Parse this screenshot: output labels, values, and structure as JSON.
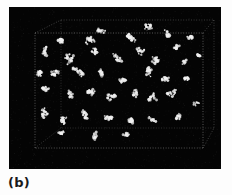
{
  "figure": {
    "caption": "(b)",
    "panel": {
      "name": "simulation-snapshot",
      "background_color": "#040404",
      "particle_color": "#f2f2f2",
      "box_edge_color": "#8a8a8a",
      "x": 9,
      "y": 7,
      "width": 212,
      "height": 162
    }
  },
  "page": {
    "background_color": "#fdfdfd",
    "text_color": "#1a1a1a"
  },
  "chart_data": {
    "type": "scatter",
    "title": "",
    "subtitle": "",
    "xlabel": "",
    "ylabel": "",
    "zlabel": "",
    "legend": [],
    "annotations": [
      "(b)"
    ],
    "grid": false,
    "projection": "3d-perspective-wireframe-cube",
    "bounding_box": {
      "front_face": {
        "x0": 35,
        "y0": 33,
        "x1": 203,
        "y1": 148
      },
      "back_face": {
        "x0": 61,
        "y0": 20,
        "x1": 214,
        "y1": 128
      },
      "edge_style": "dotted",
      "edge_color": "#8a8a8a"
    },
    "xlim": [
      0,
      1
    ],
    "ylim": [
      0,
      1
    ],
    "zlim": [
      0,
      1
    ],
    "series": [
      {
        "name": "aggregate clusters",
        "marker": "fractal-cluster",
        "color": "#f2f2f2",
        "cluster_count": 42,
        "clusters": [
          {
            "cx": 62,
            "cy": 42,
            "r": 7,
            "n": 16
          },
          {
            "cx": 90,
            "cy": 36,
            "r": 9,
            "n": 20
          },
          {
            "cx": 103,
            "cy": 31,
            "r": 6,
            "n": 12
          },
          {
            "cx": 129,
            "cy": 39,
            "r": 8,
            "n": 18
          },
          {
            "cx": 146,
            "cy": 30,
            "r": 7,
            "n": 15
          },
          {
            "cx": 165,
            "cy": 34,
            "r": 6,
            "n": 13
          },
          {
            "cx": 176,
            "cy": 46,
            "r": 5,
            "n": 10
          },
          {
            "cx": 190,
            "cy": 39,
            "r": 4,
            "n": 8
          },
          {
            "cx": 44,
            "cy": 52,
            "r": 6,
            "n": 13
          },
          {
            "cx": 70,
            "cy": 57,
            "r": 8,
            "n": 18
          },
          {
            "cx": 96,
            "cy": 52,
            "r": 6,
            "n": 12
          },
          {
            "cx": 118,
            "cy": 56,
            "r": 7,
            "n": 15
          },
          {
            "cx": 140,
            "cy": 53,
            "r": 6,
            "n": 12
          },
          {
            "cx": 158,
            "cy": 59,
            "r": 7,
            "n": 15
          },
          {
            "cx": 182,
            "cy": 62,
            "r": 6,
            "n": 12
          },
          {
            "cx": 200,
            "cy": 55,
            "r": 4,
            "n": 7
          },
          {
            "cx": 38,
            "cy": 70,
            "r": 7,
            "n": 15
          },
          {
            "cx": 57,
            "cy": 74,
            "r": 6,
            "n": 13
          },
          {
            "cx": 78,
            "cy": 70,
            "r": 8,
            "n": 18
          },
          {
            "cx": 100,
            "cy": 74,
            "r": 6,
            "n": 13
          },
          {
            "cx": 120,
            "cy": 78,
            "r": 7,
            "n": 15
          },
          {
            "cx": 145,
            "cy": 73,
            "r": 8,
            "n": 17
          },
          {
            "cx": 164,
            "cy": 80,
            "r": 6,
            "n": 12
          },
          {
            "cx": 186,
            "cy": 76,
            "r": 5,
            "n": 10
          },
          {
            "cx": 48,
            "cy": 92,
            "r": 7,
            "n": 16
          },
          {
            "cx": 68,
            "cy": 96,
            "r": 6,
            "n": 12
          },
          {
            "cx": 88,
            "cy": 91,
            "r": 8,
            "n": 18
          },
          {
            "cx": 110,
            "cy": 97,
            "r": 6,
            "n": 13
          },
          {
            "cx": 132,
            "cy": 93,
            "r": 7,
            "n": 15
          },
          {
            "cx": 152,
            "cy": 99,
            "r": 6,
            "n": 12
          },
          {
            "cx": 174,
            "cy": 95,
            "r": 7,
            "n": 14
          },
          {
            "cx": 196,
            "cy": 102,
            "r": 4,
            "n": 8
          },
          {
            "cx": 42,
            "cy": 112,
            "r": 6,
            "n": 13
          },
          {
            "cx": 64,
            "cy": 118,
            "r": 7,
            "n": 15
          },
          {
            "cx": 86,
            "cy": 113,
            "r": 7,
            "n": 16
          },
          {
            "cx": 108,
            "cy": 120,
            "r": 6,
            "n": 12
          },
          {
            "cx": 130,
            "cy": 116,
            "r": 8,
            "n": 17
          },
          {
            "cx": 152,
            "cy": 122,
            "r": 6,
            "n": 12
          },
          {
            "cx": 176,
            "cy": 117,
            "r": 5,
            "n": 10
          },
          {
            "cx": 60,
            "cy": 136,
            "r": 6,
            "n": 12
          },
          {
            "cx": 96,
            "cy": 138,
            "r": 7,
            "n": 14
          },
          {
            "cx": 124,
            "cy": 134,
            "r": 5,
            "n": 10
          }
        ]
      }
    ]
  }
}
